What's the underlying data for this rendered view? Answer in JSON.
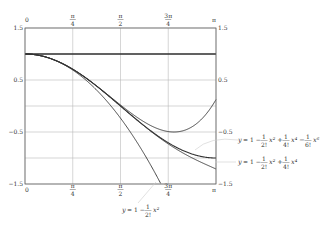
{
  "chart_data": {
    "type": "line",
    "title": "",
    "xlabel": "",
    "ylabel": "",
    "xlim": [
      0,
      3.14159
    ],
    "ylim": [
      -1.5,
      1.5
    ],
    "grid": true,
    "x_ticks": [
      {
        "value": 0,
        "label": "0"
      },
      {
        "value": 0.7854,
        "label": "π/4"
      },
      {
        "value": 1.5708,
        "label": "π/2"
      },
      {
        "value": 2.3562,
        "label": "3π/4"
      },
      {
        "value": 3.14159,
        "label": "π"
      }
    ],
    "y_ticks_left": [
      "1.5",
      "0.5",
      "−0.5",
      "−1.5"
    ],
    "y_ticks_right": [
      "1.5",
      "0.5",
      "−0.5",
      "−1.5"
    ],
    "y_tick_values": [
      1.5,
      0.5,
      -0.5,
      -1.5
    ],
    "series": [
      {
        "name": "y = 1",
        "order": 0
      },
      {
        "name": "y = 1 − x²/2!",
        "order": 2
      },
      {
        "name": "y = 1 − x²/2! + x⁴/4!",
        "order": 4
      },
      {
        "name": "y = 1 − x²/2! + x⁴/4! − x⁶/6!",
        "order": 6
      },
      {
        "name": "y = cos x",
        "order": -1
      }
    ],
    "annotations": [
      {
        "text": "y = 1 − 1/2! x² + 1/4! x⁴ − 1/6! x⁶",
        "position": "right",
        "y": -0.75
      },
      {
        "text": "y = 1 − 1/2! x² + 1/4! x⁴",
        "position": "right",
        "y": -1.05
      },
      {
        "text": "y = 1 − 1/2! x²",
        "position": "bottom",
        "x": 2.0
      }
    ]
  }
}
